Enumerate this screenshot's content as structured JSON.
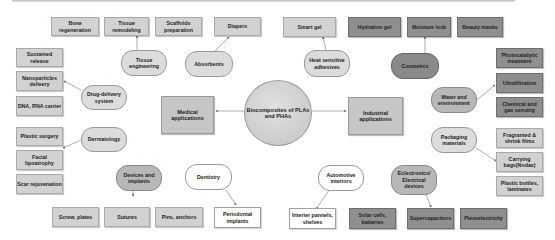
{
  "center": {
    "label": "Biocomposites of PLAs and PHAs"
  },
  "medical": {
    "label": "Medical applications",
    "groups": {
      "tissue_engineering": {
        "label": "Tissue engineering",
        "items": [
          "Bone regeneration",
          "Tissue remodeling",
          "Scaffolds preparation"
        ]
      },
      "absorbents": {
        "label": "Absorbents",
        "items": [
          "Diapers"
        ]
      },
      "drug_delivery": {
        "label": "Drug-delivery system",
        "items": [
          "Sustained release",
          "Nanoparticles delivery",
          "DNA, RNA carrier"
        ]
      },
      "dermatology": {
        "label": "Dermatology",
        "items": [
          "Plastic surgery",
          "Facial lipoatrophy",
          "Scar rejuvenation"
        ]
      },
      "devices": {
        "label": "Devices and implants",
        "items": [
          "Screw, plates",
          "Sutures",
          "Pins, anchors"
        ]
      },
      "dentistry": {
        "label": "Dentistry",
        "items": [
          "Periodontal implants"
        ]
      }
    }
  },
  "industrial": {
    "label": "Industrial applications",
    "groups": {
      "heat": {
        "label": "Heat sensitive adhesives",
        "items": [
          "Smart gel"
        ]
      },
      "cosmetics": {
        "label": "Cosmetics",
        "items": [
          "Hydration gel",
          "Moisture lock",
          "Beauty masks"
        ]
      },
      "water": {
        "label": "Water and environment",
        "items": [
          "Photocatalytic treatment",
          "Ultrafiltration",
          "Chemical and gas sensing"
        ]
      },
      "packaging": {
        "label": "Packaging materials",
        "items": [
          "Fragranted & shrink films",
          "Carrying bags(Nodax)",
          "Plastic bottles, laminates"
        ]
      },
      "automotive": {
        "label": "Automotive interiors",
        "items": [
          "Interier pannels, shelves"
        ]
      },
      "electronics": {
        "label": "Eclectronics/ Electrical devices",
        "items": [
          "Solar cells, batteries",
          "Supercapacitors",
          "Piezoelectricity"
        ]
      }
    }
  }
}
